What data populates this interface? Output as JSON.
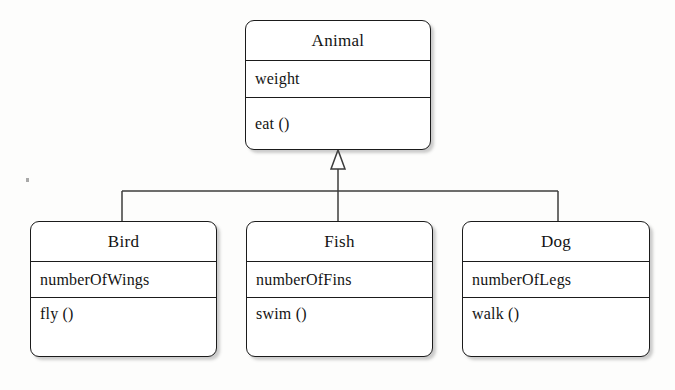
{
  "diagram": {
    "kind": "uml-class-diagram",
    "relationship": "generalization",
    "arrow_icon": "hollow-triangle-inheritance-arrow",
    "ink_color": "#1b1b1b",
    "background_color": "#fdfdfc",
    "superclass": {
      "name": "Animal",
      "attributes": [
        "weight"
      ],
      "operations": [
        "eat ()"
      ]
    },
    "subclasses": [
      {
        "name": "Bird",
        "attributes": [
          "numberOfWings"
        ],
        "operations": [
          "fly ()"
        ]
      },
      {
        "name": "Fish",
        "attributes": [
          "numberOfFins"
        ],
        "operations": [
          "swim ()"
        ]
      },
      {
        "name": "Dog",
        "attributes": [
          "numberOfLegs"
        ],
        "operations": [
          "walk ()"
        ]
      }
    ]
  }
}
